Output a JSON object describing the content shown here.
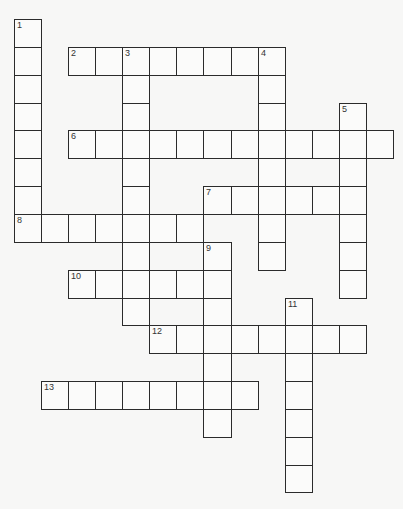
{
  "puzzle": {
    "type": "crossword",
    "colors": {
      "background": "#f7f7f6",
      "cell": "#fbfbfa",
      "grid_line": "#2b2b2b",
      "number": "#333333"
    },
    "grid": {
      "origin_x": 14,
      "origin_y": 19,
      "cell_w": 27.07,
      "cell_h": 27.85,
      "cols": 14,
      "rows": 17
    },
    "entries": [
      {
        "number": "1",
        "direction": "down",
        "row": 0,
        "col": 0,
        "length": 8
      },
      {
        "number": "2",
        "direction": "across",
        "row": 1,
        "col": 2,
        "length": 8
      },
      {
        "number": "3",
        "direction": "down",
        "row": 1,
        "col": 4,
        "length": 10
      },
      {
        "number": "4",
        "direction": "down",
        "row": 1,
        "col": 9,
        "length": 8
      },
      {
        "number": "5",
        "direction": "down",
        "row": 3,
        "col": 12,
        "length": 7
      },
      {
        "number": "6",
        "direction": "across",
        "row": 4,
        "col": 2,
        "length": 12
      },
      {
        "number": "7",
        "direction": "across",
        "row": 6,
        "col": 7,
        "length": 6
      },
      {
        "number": "8",
        "direction": "across",
        "row": 7,
        "col": 0,
        "length": 7
      },
      {
        "number": "9",
        "direction": "down",
        "row": 8,
        "col": 7,
        "length": 7
      },
      {
        "number": "10",
        "direction": "across",
        "row": 9,
        "col": 2,
        "length": 6
      },
      {
        "number": "11",
        "direction": "down",
        "row": 10,
        "col": 10,
        "length": 7
      },
      {
        "number": "12",
        "direction": "across",
        "row": 11,
        "col": 5,
        "length": 8
      },
      {
        "number": "13",
        "direction": "across",
        "row": 13,
        "col": 1,
        "length": 8
      }
    ]
  }
}
